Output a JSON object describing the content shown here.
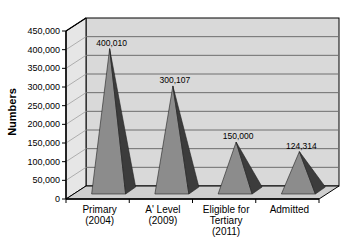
{
  "chart_data": {
    "type": "bar",
    "style": "3d-pyramid",
    "title": "",
    "xlabel": "",
    "ylabel": "Numbers",
    "ylim": [
      0,
      450000
    ],
    "yticks": [
      0,
      50000,
      100000,
      150000,
      200000,
      250000,
      300000,
      350000,
      400000,
      450000
    ],
    "ytick_labels": [
      "0",
      "50,000",
      "100,000",
      "150,000",
      "200,000",
      "250,000",
      "300,000",
      "350,000",
      "400,000",
      "450,000"
    ],
    "categories": [
      "Primary (2004)",
      "A' Level (2009)",
      "Eligible for Tertiary (2011)",
      "Admitted"
    ],
    "category_lines": [
      [
        "Primary",
        "(2004)"
      ],
      [
        "A' Level",
        "(2009)"
      ],
      [
        "Eligible for",
        "Tertiary",
        "(2011)"
      ],
      [
        "Admitted"
      ]
    ],
    "values": [
      400010,
      300107,
      150000,
      124314
    ],
    "data_labels": [
      "400,010",
      "300,107",
      "150,000",
      "124,314"
    ],
    "grid": true,
    "legend": "none"
  },
  "colors": {
    "wall": "#d9d9d9",
    "side_wall": "#e6e6e6",
    "floor": "#cfcfcf",
    "grid": "#6e6e6e",
    "pyramid_front": "#8c8c8c",
    "pyramid_side": "#3c3c3c",
    "axis": "#000000"
  }
}
